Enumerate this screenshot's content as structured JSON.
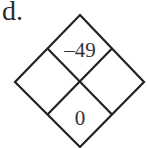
{
  "problem": {
    "label": "d.",
    "type": "diamond-problem",
    "cells": {
      "top": "–49",
      "left": "",
      "right": "",
      "bottom": "0"
    },
    "colors": {
      "lines": "#222222",
      "text": "#333333",
      "background": "#ffffff"
    }
  }
}
